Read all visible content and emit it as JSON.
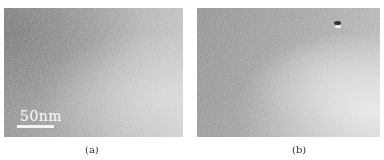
{
  "figure": {
    "panels": [
      {
        "id": "a",
        "caption": "(a)",
        "scale_bar": {
          "label": "50nm"
        },
        "tone": "grayscale micrograph, darker upper-left, lighter lower-right"
      },
      {
        "id": "b",
        "caption": "(b)",
        "tone": "grayscale micrograph, lighter lower-right, small dark/bright spot near top-right"
      }
    ],
    "colors": {
      "background": "#ffffff",
      "micrograph_mid_gray": "#a3a3a3",
      "scale_bar": "#f2f2f2",
      "caption_text": "#333333"
    }
  }
}
